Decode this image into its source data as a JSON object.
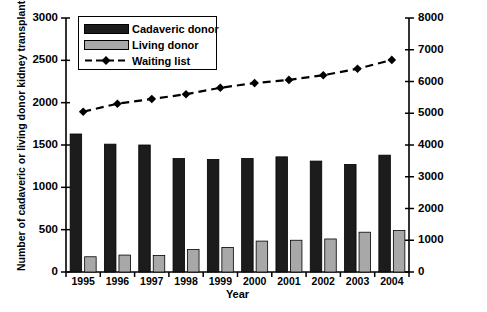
{
  "chart_data": {
    "type": "bar",
    "title": "",
    "xlabel": "Year",
    "ylabel": "Number of cadaveric or living donor kidney transplants",
    "y2label": "Number on waiting list",
    "categories": [
      "1995",
      "1996",
      "1997",
      "1998",
      "1999",
      "2000",
      "2001",
      "2002",
      "2003",
      "2004"
    ],
    "ylim": [
      0,
      3000
    ],
    "y2lim": [
      0,
      8000
    ],
    "yticks": [
      0,
      500,
      1000,
      1500,
      2000,
      2500,
      3000
    ],
    "y2ticks": [
      0,
      1000,
      2000,
      3000,
      4000,
      5000,
      6000,
      7000,
      8000
    ],
    "grid": false,
    "legend_position": "top-left",
    "series": [
      {
        "name": "Cadaveric donor",
        "type": "bar",
        "axis": "left",
        "color": "#1c1c1c",
        "values": [
          1630,
          1510,
          1500,
          1340,
          1330,
          1340,
          1360,
          1310,
          1270,
          1380
        ]
      },
      {
        "name": "Living donor",
        "type": "bar",
        "axis": "left",
        "color": "#a8a8a8",
        "values": [
          180,
          200,
          195,
          265,
          290,
          365,
          375,
          390,
          470,
          490
        ]
      },
      {
        "name": "Waiting list",
        "type": "line",
        "axis": "right",
        "color": "#000000",
        "values": [
          5050,
          5300,
          5450,
          5600,
          5800,
          5950,
          6050,
          6200,
          6400,
          6680
        ]
      }
    ]
  },
  "legend": {
    "items": [
      {
        "label": "Cadaveric donor",
        "marker": "dark-square-swatch"
      },
      {
        "label": "Living donor",
        "marker": "gray-square-swatch"
      },
      {
        "label": "Waiting list",
        "marker": "dashed-line-diamond"
      }
    ]
  },
  "axes": {
    "left_title": "Number of cadaveric or living donor kidney transplants",
    "right_title": "Number on waiting list",
    "x_title": "Year",
    "left_ticks": [
      "0",
      "500",
      "1000",
      "1500",
      "2000",
      "2500",
      "3000"
    ],
    "right_ticks": [
      "0",
      "1000",
      "2000",
      "3000",
      "4000",
      "5000",
      "6000",
      "7000",
      "8000"
    ],
    "x_ticks": [
      "1995",
      "1996",
      "1997",
      "1998",
      "1999",
      "2000",
      "2001",
      "2002",
      "2003",
      "2004"
    ]
  }
}
